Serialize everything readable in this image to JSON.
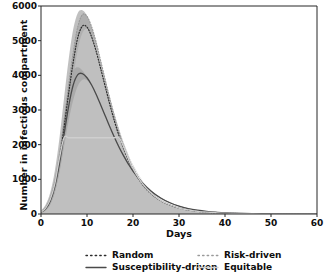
{
  "chart_data": {
    "type": "line",
    "title": "",
    "subtitle": "",
    "xlabel": "Days",
    "ylabel": "Number in infectious compartment",
    "xlim": [
      0,
      60
    ],
    "ylim": [
      0,
      6000
    ],
    "xticks": [
      0,
      10,
      20,
      30,
      40,
      50,
      60
    ],
    "yticks": [
      0,
      1000,
      2000,
      3000,
      4000,
      5000,
      6000
    ],
    "grid": false,
    "legend_position": "below-axes",
    "x": [
      0,
      1,
      2,
      3,
      4,
      5,
      6,
      7,
      8,
      9,
      10,
      11,
      12,
      13,
      14,
      15,
      16,
      17,
      18,
      19,
      20,
      22,
      24,
      26,
      28,
      30,
      32,
      34,
      36,
      38,
      40,
      44,
      48,
      52,
      56,
      60
    ],
    "series": [
      {
        "name": "Risk-driven",
        "style": "dotted",
        "color": "#9a9a9a",
        "peak_value": 5750,
        "peak_day": 9,
        "values": [
          60,
          180,
          430,
          900,
          1650,
          2650,
          3700,
          4650,
          5400,
          5750,
          5700,
          5400,
          4950,
          4400,
          3850,
          3300,
          2800,
          2350,
          1960,
          1620,
          1340,
          900,
          600,
          400,
          265,
          175,
          118,
          80,
          54,
          37,
          25,
          12,
          6,
          3,
          1.5,
          1
        ]
      },
      {
        "name": "Random",
        "style": "dotted",
        "color": "#2b2b2b",
        "peak_value": 5420,
        "peak_day": 9,
        "values": [
          55,
          165,
          400,
          840,
          1540,
          2480,
          3470,
          4380,
          5090,
          5420,
          5390,
          5110,
          4690,
          4180,
          3660,
          3140,
          2665,
          2240,
          1870,
          1550,
          1280,
          865,
          578,
          385,
          255,
          169,
          114,
          77,
          52,
          36,
          24,
          11,
          5.5,
          3,
          1.4,
          0.9
        ]
      },
      {
        "name": "Susceptibility-driven",
        "style": "solid",
        "color": "#4a4a4a",
        "peak_value": 4050,
        "peak_day": 8,
        "values": [
          50,
          150,
          370,
          790,
          1450,
          2280,
          3100,
          3720,
          4020,
          4050,
          3930,
          3720,
          3450,
          3140,
          2820,
          2500,
          2200,
          1920,
          1670,
          1440,
          1240,
          905,
          650,
          462,
          325,
          227,
          158,
          110,
          76,
          53,
          36,
          17,
          8,
          4,
          2,
          1
        ]
      },
      {
        "name": "Equitable",
        "style": "solid",
        "color": "#cfcfcf",
        "peak_value": 2200,
        "peak_day": 9,
        "values": [
          58,
          172,
          415,
          870,
          1600,
          2200,
          2200,
          2200,
          2200,
          2200,
          2200,
          2200,
          2200,
          2200,
          2200,
          2200,
          2200,
          2200,
          1915,
          1585,
          1310,
          882,
          589,
          392,
          260,
          172,
          116,
          78,
          53,
          36,
          24,
          11,
          6,
          3,
          1.4,
          0.9
        ]
      }
    ],
    "bands": [
      {
        "name": "Risk-driven-ci",
        "color": "#b5b5b5",
        "upper": [
          90,
          265,
          610,
          1240,
          2180,
          3330,
          4450,
          5330,
          5800,
          5880,
          5720,
          5380,
          4900,
          4360,
          3820,
          3300,
          2820,
          2390,
          2010,
          1680,
          1400,
          965,
          655,
          445,
          300,
          202,
          138,
          94,
          64,
          44,
          30,
          14,
          7,
          3.5,
          1.8,
          1.2
        ],
        "lower": [
          30,
          100,
          270,
          620,
          1220,
          2070,
          3030,
          3940,
          4740,
          5220,
          5340,
          5180,
          4830,
          4370,
          3870,
          3360,
          2880,
          2440,
          2050,
          1710,
          1420,
          975,
          660,
          445,
          300,
          202,
          137,
          93,
          63,
          43,
          29,
          14,
          7,
          3.4,
          1.7,
          1.1
        ]
      },
      {
        "name": "Susceptibility-driven-ci",
        "color": "#9d9d9d",
        "upper": [
          75,
          215,
          510,
          1040,
          1830,
          2780,
          3620,
          4120,
          4230,
          4140,
          3950,
          3720,
          3440,
          3140,
          2830,
          2520,
          2230,
          1955,
          1705,
          1480,
          1280,
          940,
          680,
          485,
          343,
          241,
          168,
          117,
          81,
          56,
          39,
          18,
          9,
          4.3,
          2.1,
          1.1
        ],
        "lower": [
          34,
          105,
          275,
          620,
          1180,
          1930,
          2680,
          3280,
          3690,
          3870,
          3860,
          3710,
          3460,
          3150,
          2820,
          2500,
          2190,
          1900,
          1645,
          1415,
          1215,
          885,
          635,
          450,
          316,
          220,
          153,
          106,
          73,
          50,
          34,
          16,
          7.5,
          3.6,
          1.8,
          0.9
        ]
      }
    ]
  },
  "legend": {
    "items": [
      {
        "label": "Random",
        "style": "dotted",
        "color": "#2b2b2b"
      },
      {
        "label": "Risk-driven",
        "style": "dotted",
        "color": "#9a9a9a"
      },
      {
        "label": "Susceptibility-driven",
        "style": "solid",
        "color": "#4a4a4a"
      },
      {
        "label": "Equitable",
        "style": "solid",
        "color": "#cfcfcf"
      }
    ]
  },
  "axes": {
    "x_ticklabels": [
      "0",
      "10",
      "20",
      "30",
      "40",
      "50",
      "60"
    ],
    "y_ticklabels": [
      "0",
      "1000",
      "2000",
      "3000",
      "4000",
      "5000",
      "6000"
    ],
    "x_title": "Days",
    "y_title": "Number in infectious compartment",
    "spine_color": "#262626"
  }
}
